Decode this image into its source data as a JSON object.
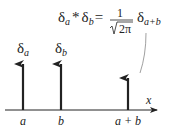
{
  "formula": {
    "lhs_delta1": "δ",
    "lhs_sub1": "a",
    "op": "*",
    "lhs_delta2": "δ",
    "lhs_sub2": "b",
    "eq": "=",
    "numerator": "1",
    "denominator": "2π",
    "rhs_delta": "δ",
    "rhs_sub": "a+b"
  },
  "labels": {
    "delta_a": "δ",
    "delta_a_sub": "a",
    "delta_b": "δ",
    "delta_b_sub": "b",
    "axis_x": "x",
    "tick_a": "a",
    "tick_b": "b",
    "tick_a_plus_b": "a + b"
  },
  "colors": {
    "ink": "#222222",
    "leader": "#888888"
  }
}
